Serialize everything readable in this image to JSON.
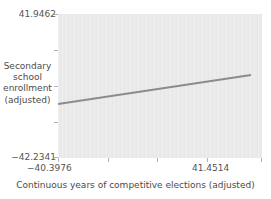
{
  "chart_data": {
    "type": "line",
    "title": "",
    "subtitle": "",
    "xlabel": "Continuous years of competitive elections (adjusted)",
    "ylabel": "Secondary school enrollment (adjusted)",
    "ylabel_lines": [
      "Secondary",
      "school",
      "enrollment",
      "(adjusted)"
    ],
    "xlim": [
      -40.3976,
      41.4514
    ],
    "ylim": [
      -42.2341,
      41.9462
    ],
    "xtick_labels": [
      "−40.3976",
      "41.4514"
    ],
    "ytick_labels": [
      "41.9462",
      "−42.2341"
    ],
    "xticks": [
      -40.3976,
      41.4514
    ],
    "yticks": [
      -42.2341,
      41.9462
    ],
    "grid": false,
    "legend": false,
    "legend_position": "none",
    "panel_background": "#e9e9e9",
    "series": [
      {
        "name": "fitted regression line",
        "type": "line",
        "color": "#8c8c8c",
        "linewidth": 2,
        "x": [
          -40.3976,
          41.4514
        ],
        "y": [
          -9.1,
          7.8
        ],
        "x_pixel": [
          58,
          251
        ],
        "y_pixel": [
          104,
          75
        ],
        "slope_positive": true
      }
    ],
    "annotations": []
  },
  "axes": {
    "y_top_label": "41.9462",
    "y_bottom_label": "−42.2341",
    "x_left_label": "−40.3976",
    "x_right_label": "41.4514",
    "x_title": "Continuous years of competitive elections (adjusted)",
    "y_title_lines": [
      "Secondary",
      "school",
      "enrollment",
      "(adjusted)"
    ]
  },
  "colors": {
    "panel": "#e9e9e9",
    "line": "#8c8c8c",
    "tick": "#b4b4b4",
    "text": "#4a4a4a",
    "background": "#ffffff"
  }
}
